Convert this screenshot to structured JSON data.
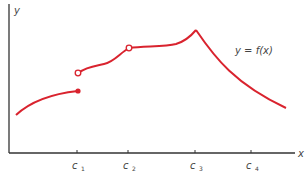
{
  "diagram": {
    "axis_labels": {
      "x": "x",
      "y": "y"
    },
    "function_label": "y = f(x)",
    "ticks": [
      {
        "base": "c",
        "sub": "1"
      },
      {
        "base": "c",
        "sub": "2"
      },
      {
        "base": "c",
        "sub": "3"
      },
      {
        "base": "c",
        "sub": "4"
      }
    ],
    "colors": {
      "curve": "#d9232e",
      "axis": "#333333",
      "text": "#444444"
    },
    "features": {
      "c1": "jump discontinuity (filled endpoint below, open circle above)",
      "c2": "removable discontinuity (open circle)",
      "c3": "corner / cusp (peak)",
      "c4": "continuous"
    }
  }
}
